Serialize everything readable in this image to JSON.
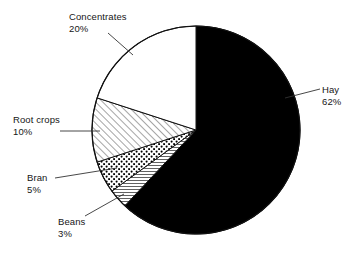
{
  "chart_data": {
    "type": "pie",
    "title": "",
    "subtitle": "",
    "xlabel": "",
    "ylabel": "",
    "legend_position": "none",
    "grid": false,
    "labels_outside": true,
    "units": "%",
    "start_angle_deg": 0,
    "direction": "clockwise",
    "categories": [
      "Hay",
      "Beans",
      "Bran",
      "Root crops",
      "Concentrates"
    ],
    "values": [
      62,
      3,
      5,
      10,
      20
    ],
    "slices": [
      {
        "name": "Hay",
        "label": "Hay",
        "value": 62,
        "value_label": "62%",
        "fill": "solid-black",
        "color": "#000000",
        "start_deg": 0,
        "end_deg": 223.2
      },
      {
        "name": "Beans",
        "label": "Beans",
        "value": 3,
        "value_label": "3%",
        "fill": "horizontal-lines",
        "color": "#ffffff",
        "start_deg": 223.2,
        "end_deg": 234.0
      },
      {
        "name": "Bran",
        "label": "Bran",
        "value": 5,
        "value_label": "5%",
        "fill": "dots",
        "color": "#ffffff",
        "start_deg": 234.0,
        "end_deg": 252.0
      },
      {
        "name": "Root crops",
        "label": "Root crops",
        "value": 10,
        "value_label": "10%",
        "fill": "diagonal-hatch",
        "color": "#ffffff",
        "start_deg": 252.0,
        "end_deg": 288.0
      },
      {
        "name": "Concentrates",
        "label": "Concentrates",
        "value": 20,
        "value_label": "20%",
        "fill": "none-white",
        "color": "#ffffff",
        "start_deg": 288.0,
        "end_deg": 360.0
      }
    ]
  },
  "colors": {
    "background": "#ffffff",
    "outline": "#111111",
    "text": "#161616",
    "leader_line": "#333333"
  },
  "labels": {
    "concentrates": {
      "name": "Concentrates",
      "value": "20%"
    },
    "hay": {
      "name": "Hay",
      "value": "62%"
    },
    "root_crops": {
      "name": "Root crops",
      "value": "10%"
    },
    "bran": {
      "name": "Bran",
      "value": "5%"
    },
    "beans": {
      "name": "Beans",
      "value": "3%"
    }
  }
}
